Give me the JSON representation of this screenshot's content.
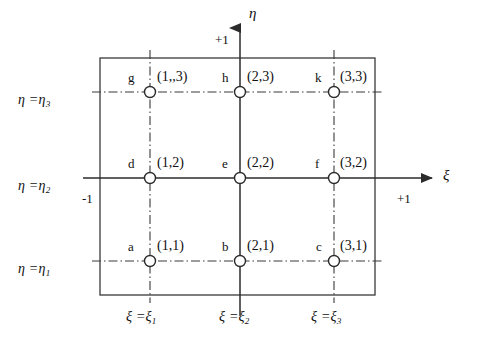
{
  "figure": {
    "axes": {
      "vertical_name": "η",
      "horizontal_name": "ξ",
      "top_extent": "+1",
      "right_extent": "+1",
      "left_extent": "-1"
    },
    "eta_lines": [
      {
        "label_prefix": "η =",
        "label_symbol": "η",
        "label_sub": "3",
        "name": "eta-3"
      },
      {
        "label_prefix": "η =",
        "label_symbol": "η",
        "label_sub": "2",
        "name": "eta-2"
      },
      {
        "label_prefix": "η =",
        "label_symbol": "η",
        "label_sub": "1",
        "name": "eta-1"
      }
    ],
    "xi_lines": [
      {
        "label_prefix": "ξ =",
        "label_symbol": "ξ",
        "label_sub": "1",
        "name": "xi-1"
      },
      {
        "label_prefix": "ξ =",
        "label_symbol": "ξ",
        "label_sub": "2",
        "name": "xi-2"
      },
      {
        "label_prefix": "ξ =",
        "label_symbol": "ξ",
        "label_sub": "3",
        "name": "xi-3"
      }
    ],
    "nodes": [
      {
        "letter": "g",
        "index": "(1,,3)",
        "row": 3,
        "col": 1
      },
      {
        "letter": "h",
        "index": "(2,3)",
        "row": 3,
        "col": 2
      },
      {
        "letter": "k",
        "index": "(3,3)",
        "row": 3,
        "col": 3
      },
      {
        "letter": "d",
        "index": "(1,2)",
        "row": 2,
        "col": 1
      },
      {
        "letter": "e",
        "index": "(2,2)",
        "row": 2,
        "col": 2
      },
      {
        "letter": "f",
        "index": "(3,2)",
        "row": 2,
        "col": 3
      },
      {
        "letter": "a",
        "index": "(1,1)",
        "row": 1,
        "col": 1
      },
      {
        "letter": "b",
        "index": "(2,1)",
        "row": 1,
        "col": 2
      },
      {
        "letter": "c",
        "index": "(3,1)",
        "row": 1,
        "col": 3
      }
    ],
    "colors": {
      "line": "#3a3a3a",
      "axis": "#2b2b2b",
      "text": "#111111",
      "background": "#ffffff"
    }
  }
}
